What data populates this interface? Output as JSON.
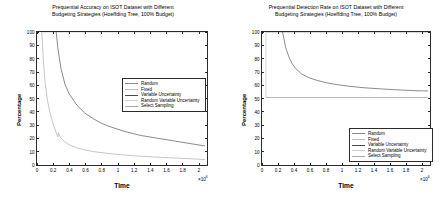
{
  "figures": [
    {
      "id": "prequential-accuracy",
      "title_line1": "Prequential Accuracy on ISOT Dataset with Different",
      "title_line2": "Budgeting Strategies (Hoeffding Tree, 100% Budget)",
      "xlabel": "Time",
      "ylabel": "Percentage",
      "exponent": "10",
      "exponent_power": "6",
      "exponent_prefix": "×",
      "yticks": [
        "0",
        "10",
        "20",
        "30",
        "40",
        "50",
        "60",
        "70",
        "80",
        "90",
        "100"
      ],
      "xticks": [
        "0",
        "0.2",
        "0.4",
        "0.6",
        "0.8",
        "1",
        "1.2",
        "1.4",
        "1.6",
        "1.8",
        "2"
      ],
      "legend": [
        {
          "label": "Random",
          "color": "#8a8a8a"
        },
        {
          "label": "Fixed",
          "color": "#bdbdbd"
        },
        {
          "label": "Variable Uncertainty",
          "color": "#4a4a4a"
        },
        {
          "label": "Random Variable Uncertainty",
          "color": "#cfcfcf"
        },
        {
          "label": "Select Sampling",
          "color": "#a8a8a8"
        }
      ]
    },
    {
      "id": "prequential-detection-rate",
      "title_line1": "Prequential Detection Rate on ISOT Dataset with Different",
      "title_line2": "Budgeting Strategies (Hoeffding Tree, 100% Budget)",
      "xlabel": "Time",
      "ylabel": "Percentage",
      "exponent": "10",
      "exponent_power": "6",
      "exponent_prefix": "×",
      "yticks": [
        "0",
        "10",
        "20",
        "30",
        "40",
        "50",
        "60",
        "70",
        "80",
        "90",
        "100"
      ],
      "xticks": [
        "0",
        "0.2",
        "0.4",
        "0.6",
        "0.8",
        "1",
        "1.2",
        "1.4",
        "1.6",
        "1.8",
        "2"
      ],
      "legend": [
        {
          "label": "Random",
          "color": "#8a8a8a"
        },
        {
          "label": "Fixed",
          "color": "#bdbdbd"
        },
        {
          "label": "Variable Uncertainty",
          "color": "#4a4a4a"
        },
        {
          "label": "Random Variable Uncertainty",
          "color": "#cfcfcf"
        },
        {
          "label": "Select Sampling",
          "color": "#a8a8a8"
        }
      ]
    }
  ],
  "chart_data": [
    {
      "type": "line",
      "title": "Prequential Accuracy on ISOT Dataset with Different Budgeting Strategies (Hoeffding Tree, 100% Budget)",
      "xlabel": "Time",
      "ylabel": "Percentage",
      "x_multiplier": 1000000,
      "xlim": [
        0,
        2.1
      ],
      "ylim": [
        0,
        100
      ],
      "xticks": [
        0,
        0.2,
        0.4,
        0.6,
        0.8,
        1,
        1.2,
        1.4,
        1.6,
        1.8,
        2
      ],
      "yticks": [
        0,
        10,
        20,
        30,
        40,
        50,
        60,
        70,
        80,
        90,
        100
      ],
      "grid": false,
      "legend_position": "right-upper-inside",
      "series": [
        {
          "name": "Random",
          "color": "#8a8a8a",
          "x": [
            0.05,
            0.05
          ],
          "values": [
            100,
            100
          ],
          "note": "flat at 100 along top, overlapped by axis frame"
        },
        {
          "name": "Fixed",
          "color": "#bdbdbd",
          "x": [
            0.05,
            2.1
          ],
          "values": [
            100,
            100
          ],
          "note": "flat at 100 along top, overlapped by axis frame"
        },
        {
          "name": "Variable Uncertainty",
          "color": "#4a4a4a",
          "x": [
            0.24,
            0.26,
            0.3,
            0.35,
            0.4,
            0.5,
            0.6,
            0.7,
            0.8,
            0.9,
            1.0,
            1.1,
            1.2,
            1.3,
            1.4,
            1.5,
            1.6,
            1.7,
            1.8,
            1.9,
            2.0,
            2.1
          ],
          "values": [
            100,
            88,
            72,
            60,
            53,
            44,
            38,
            34,
            30.5,
            28,
            26,
            24,
            22.5,
            21,
            20,
            19,
            18,
            17,
            16,
            15,
            14,
            13
          ]
        },
        {
          "name": "Random Variable Uncertainty",
          "color": "#cfcfcf",
          "x": [
            0.06,
            0.06
          ],
          "values": [
            100,
            100
          ],
          "note": "vertical segment near left axis"
        },
        {
          "name": "Select Sampling",
          "color": "#a8a8a8",
          "x": [
            0.06,
            0.08,
            0.1,
            0.13,
            0.16,
            0.2,
            0.24,
            0.26,
            0.27,
            0.28,
            0.3,
            0.35,
            0.4,
            0.5,
            0.6,
            0.7,
            0.8,
            0.9,
            1.0,
            1.2,
            1.4,
            1.6,
            1.8,
            2.0,
            2.1
          ],
          "values": [
            100,
            78,
            62,
            48,
            39,
            30,
            23,
            20,
            23,
            21,
            19,
            16,
            14,
            11.5,
            10,
            8.8,
            8,
            7.2,
            6.6,
            5.6,
            4.8,
            4.2,
            3.6,
            3.0,
            2.6
          ]
        }
      ]
    },
    {
      "type": "line",
      "title": "Prequential Detection Rate on ISOT Dataset with Different Budgeting Strategies (Hoeffding Tree, 100% Budget)",
      "xlabel": "Time",
      "ylabel": "Percentage",
      "x_multiplier": 1000000,
      "xlim": [
        0,
        2.1
      ],
      "ylim": [
        0,
        100
      ],
      "xticks": [
        0,
        0.2,
        0.4,
        0.6,
        0.8,
        1,
        1.2,
        1.4,
        1.6,
        1.8,
        2
      ],
      "yticks": [
        0,
        10,
        20,
        30,
        40,
        50,
        60,
        70,
        80,
        90,
        100
      ],
      "grid": false,
      "legend_position": "right-lower-inside",
      "series": [
        {
          "name": "Random",
          "color": "#8a8a8a",
          "x": [
            0.05,
            2.1
          ],
          "values": [
            100,
            100
          ],
          "note": "flat at 100 along top"
        },
        {
          "name": "Fixed",
          "color": "#bdbdbd",
          "x": [
            0.05,
            0.05
          ],
          "values": [
            100,
            50
          ],
          "note": "vertical drop at left edge from 100 to 50"
        },
        {
          "name": "Variable Uncertainty",
          "color": "#4a4a4a",
          "x": [
            0.26,
            0.28,
            0.3,
            0.34,
            0.38,
            0.42,
            0.5,
            0.6,
            0.7,
            0.8,
            0.9,
            1.0,
            1.1,
            1.2,
            1.3,
            1.4,
            1.5,
            1.6,
            1.7,
            1.8,
            1.9,
            2.0,
            2.1
          ],
          "values": [
            100,
            94,
            88,
            81,
            76,
            72.5,
            68,
            65,
            63,
            61.5,
            60.3,
            59.4,
            58.6,
            58,
            57.4,
            57,
            56.6,
            56.2,
            55.9,
            55.6,
            55.3,
            55.1,
            55
          ]
        },
        {
          "name": "Random Variable Uncertainty",
          "color": "#cfcfcf",
          "x": [
            0.05,
            2.1
          ],
          "values": [
            50,
            50
          ],
          "note": "flat horizontal at 50"
        },
        {
          "name": "Select Sampling",
          "color": "#a8a8a8",
          "x": [
            0.05,
            2.1
          ],
          "values": [
            50,
            50
          ],
          "note": "flat horizontal at 50, overlapping"
        }
      ]
    }
  ]
}
